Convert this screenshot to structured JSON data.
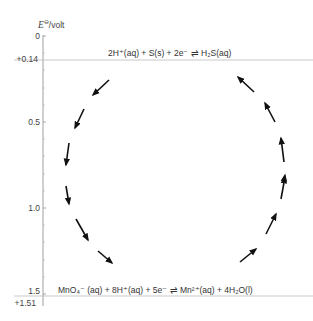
{
  "diagram": {
    "type": "redox-cycle",
    "axis": {
      "title_symbol": "E",
      "title_superscript": "⊖",
      "title_unit": "/volt",
      "orientation": "vertical, increasing downward",
      "major_ticks": [
        {
          "value": 0,
          "label": "0"
        },
        {
          "value": 0.5,
          "label": "0.5"
        },
        {
          "value": 1.0,
          "label": "1.0"
        },
        {
          "value": 1.5,
          "label": "1.5"
        }
      ],
      "marked_potentials": [
        {
          "value": 0.14,
          "label": "+0.14"
        },
        {
          "value": 1.51,
          "label": "+1.51"
        }
      ]
    },
    "equations": {
      "top": {
        "potential": "+0.14",
        "text": "2H⁺(aq) + S(s) + 2e⁻ ⇌ H₂S(aq)"
      },
      "bottom": {
        "potential": "+1.51",
        "text": "MnO₄⁻ (aq) + 8H⁺(aq) + 5e⁻ ⇌ Mn²⁺(aq) + 4H₂O(l)"
      }
    },
    "cycle": {
      "description": "Dashed circle of arrows: left side flows downward (from top equation to bottom), right side flows upward (from bottom equation to top).",
      "left_arrows": 6,
      "right_arrows": 6,
      "direction": "anticlockwise"
    },
    "colors": {
      "text": "#333333",
      "axis": "#888888",
      "guide_line": "#bbbbbb",
      "arrow": "#111111"
    }
  }
}
